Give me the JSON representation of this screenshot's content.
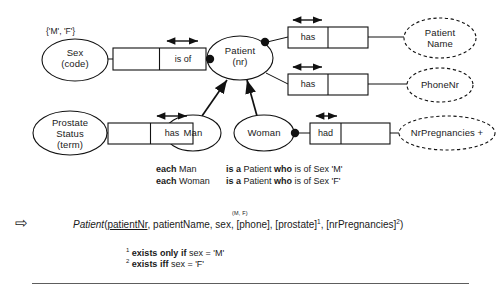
{
  "diagram": {
    "title_type": "ORM schema with subtypes and conditional attributes",
    "value_constraint": "{'M', 'F'}",
    "object_types": [
      {
        "id": "sex",
        "name": "Sex",
        "ref": "(code)",
        "kind": "entity",
        "cx": 75,
        "cy": 60,
        "rx": 33,
        "ry": 21
      },
      {
        "id": "patient",
        "name": "Patient",
        "ref": "(nr)",
        "kind": "entity",
        "cx": 240,
        "cy": 58,
        "rx": 33,
        "ry": 22
      },
      {
        "id": "prostate",
        "name": "Prostate Status",
        "ref": "(term)",
        "kind": "entity",
        "cx": 70,
        "cy": 133,
        "rx": 37,
        "ry": 22
      },
      {
        "id": "man",
        "name": "Man",
        "ref": "",
        "kind": "subtype",
        "cx": 193,
        "cy": 133,
        "rx": 28,
        "ry": 18
      },
      {
        "id": "woman",
        "name": "Woman",
        "ref": "",
        "kind": "subtype",
        "cx": 264,
        "cy": 133,
        "rx": 30,
        "ry": 18
      },
      {
        "id": "patientname",
        "name": "Patient Name",
        "ref": "",
        "kind": "value",
        "cx": 440,
        "cy": 38,
        "rx": 36,
        "ry": 20
      },
      {
        "id": "phonenr",
        "name": "PhoneNr",
        "ref": "",
        "kind": "value",
        "cx": 440,
        "cy": 85,
        "rx": 33,
        "ry": 17
      },
      {
        "id": "nrpreg",
        "name": "NrPregnancies +",
        "ref": "",
        "kind": "value",
        "cx": 447,
        "cy": 133,
        "rx": 48,
        "ry": 17
      }
    ],
    "fact_types": [
      {
        "id": "sex-isof",
        "cells": [
          "",
          "is of"
        ],
        "arrow_over_cell": 1,
        "x": 113,
        "y": 48,
        "w": 93,
        "h": 22
      },
      {
        "id": "patient-name",
        "cells": [
          "has",
          ""
        ],
        "arrow_over_cell": 0,
        "x": 288,
        "y": 27,
        "w": 80,
        "h": 21
      },
      {
        "id": "patient-phone",
        "cells": [
          "has",
          ""
        ],
        "arrow_over_cell": 0,
        "x": 288,
        "y": 74,
        "w": 80,
        "h": 21
      },
      {
        "id": "prostate-has",
        "cells": [
          "",
          "has"
        ],
        "arrow_over_cell": 1,
        "x": 108,
        "y": 123,
        "w": 85,
        "h": 21
      },
      {
        "id": "woman-had",
        "cells": [
          "had",
          ""
        ],
        "arrow_over_cell": 0,
        "x": 310,
        "y": 123,
        "w": 80,
        "h": 21
      }
    ],
    "mandatory_dots": [
      {
        "id": "dot-sex-patient",
        "cx": 210,
        "cy": 59
      },
      {
        "id": "dot-patient-name",
        "cx": 265,
        "cy": 42
      },
      {
        "id": "dot-woman-had",
        "cx": 295,
        "cy": 133
      }
    ],
    "subtype_arrows": [
      {
        "id": "man-to-patient",
        "x1": 201,
        "y1": 116,
        "x2": 226,
        "y2": 80
      },
      {
        "id": "woman-to-patient",
        "x1": 255,
        "y1": 116,
        "x2": 246,
        "y2": 80
      }
    ]
  },
  "verbalization": {
    "lines": [
      {
        "subject_kw": "each",
        "subject": "Man",
        "mid_kw": "is a",
        "mid": "Patient",
        "who_kw": "who",
        "rest": "is of Sex 'M'"
      },
      {
        "subject_kw": "each",
        "subject": "Woman",
        "mid_kw": "is a",
        "mid": "Patient",
        "who_kw": "who",
        "rest": "is of Sex 'F'"
      }
    ]
  },
  "schema": {
    "arrow_glyph": "⇨",
    "relation": "Patient",
    "open_paren": "(",
    "pk": "patientNr",
    "sex_value_mark": "(M, F)",
    "attributes": ", patientName, sex, [phone], [prostate]",
    "sup1": "1",
    "attributes2": ", [nrPregnancies]",
    "sup2": "2",
    "close_paren": ")"
  },
  "footnotes": [
    {
      "marker": "1",
      "kw": "exists only if",
      "rest": "sex = 'M'"
    },
    {
      "marker": "2",
      "kw": "exists iff",
      "rest": "sex = 'F'"
    }
  ],
  "colors": {
    "stroke": "#111111",
    "text": "#1a1a1a",
    "rule": "#5d5d5d",
    "background": "#ffffff"
  }
}
